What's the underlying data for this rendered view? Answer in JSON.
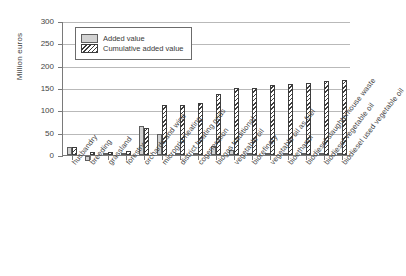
{
  "chart_data": {
    "type": "bar",
    "title": "",
    "xlabel": "",
    "ylabel": "Million euros",
    "ylim": [
      0,
      300
    ],
    "yticks": [
      0,
      50,
      100,
      150,
      200,
      250,
      300
    ],
    "grid": true,
    "legend_position": "top-left",
    "categories": [
      "husbandry",
      "breeding",
      "grassland",
      "forestry",
      "orchards and wine",
      "microgrid heating",
      "district heating grids",
      "cogeneration",
      "biogas traditional",
      "vegetable oil",
      "biorefinery",
      "vegetable oil as fuel",
      "bioethanol",
      "biodiesel slaughterhouse waste",
      "biodiesel vegetable oil",
      "biodiesel used vegetable oil"
    ],
    "series": [
      {
        "name": "Added value",
        "values": [
          17,
          -11,
          1,
          1,
          64,
          48,
          4,
          1,
          20,
          11,
          1,
          5,
          4,
          1,
          5,
          1
        ]
      },
      {
        "name": "Cumulative added value",
        "values": [
          17,
          6,
          7,
          8,
          60,
          113,
          111,
          117,
          137,
          150,
          150,
          157,
          160,
          162,
          166,
          168
        ]
      }
    ],
    "ytick_labels": [
      "0",
      "50",
      "100",
      "150",
      "200",
      "250",
      "300"
    ]
  },
  "legend": {
    "items": [
      {
        "label": "Added value",
        "swatch": "solid-gray"
      },
      {
        "label": "Cumulative added value",
        "swatch": "hatched"
      }
    ]
  },
  "colors": {
    "added_fill": "#d2d2d2",
    "added_border": "#5e5e5e",
    "cumulative_hatch": "#3d3d3d",
    "axis": "#7a7a7a",
    "gridline": "#b9b9b9",
    "text": "#3a3a3a"
  }
}
